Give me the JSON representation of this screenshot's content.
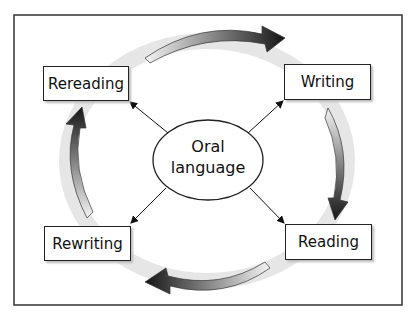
{
  "diagram": {
    "center": {
      "line1": "Oral",
      "line2": "language"
    },
    "nodes": {
      "top_left": "Rereading",
      "top_right": "Writing",
      "bottom_right": "Reading",
      "bottom_left": "Rewriting"
    },
    "cycle_direction": "clockwise",
    "colors": {
      "ring": "#e6e6e6",
      "arrow_dark": "#1a1a1a",
      "arrow_light": "#f2f2f2",
      "frame": "#333333"
    }
  }
}
